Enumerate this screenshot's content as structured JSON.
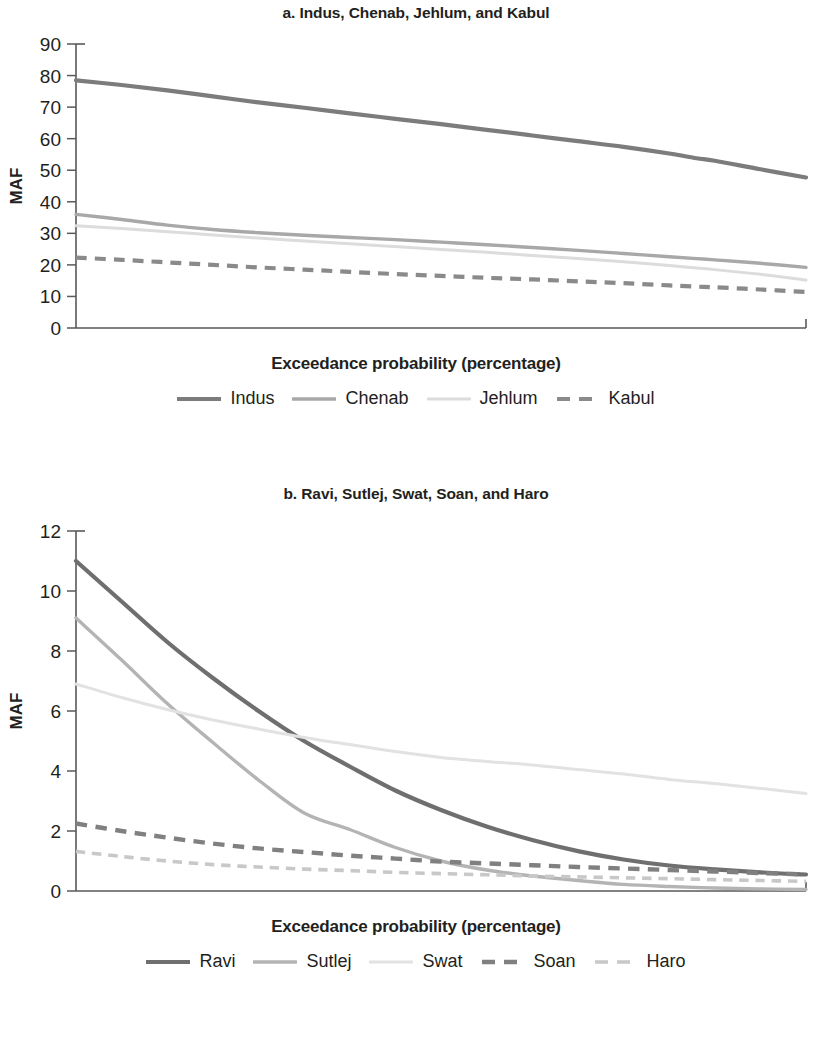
{
  "figure": {
    "y_axis_label": "MAF",
    "x_axis_label": "Exceedance probability (percentage)"
  },
  "panel_a": {
    "title": "a. Indus, Chenab, Jehlum, and Kabul",
    "x_axis_label": "Exceedance probability (percentage)",
    "y_axis_label": "MAF",
    "legend": [
      {
        "label": "Indus",
        "color": "#7c7c7c",
        "style": "solid",
        "width": 4.2
      },
      {
        "label": "Chenab",
        "color": "#a8a8a8",
        "style": "solid",
        "width": 3.4
      },
      {
        "label": "Jehlum",
        "color": "#dcdcdc",
        "style": "solid",
        "width": 3.0
      },
      {
        "label": "Kabul",
        "color": "#8a8a8a",
        "style": "dashed",
        "width": 4.2
      }
    ]
  },
  "panel_b": {
    "title": "b. Ravi, Sutlej, Swat, Soan, and Haro",
    "x_axis_label": "Exceedance probability (percentage)",
    "y_axis_label": "MAF",
    "legend": [
      {
        "label": "Ravi",
        "color": "#6f6f6f",
        "style": "solid",
        "width": 4.2
      },
      {
        "label": "Sutlej",
        "color": "#b4b4b4",
        "style": "solid",
        "width": 3.4
      },
      {
        "label": "Swat",
        "color": "#e2e2e2",
        "style": "solid",
        "width": 3.0
      },
      {
        "label": "Soan",
        "color": "#808080",
        "style": "dashed",
        "width": 4.4
      },
      {
        "label": "Haro",
        "color": "#c8c8c8",
        "style": "dashed",
        "width": 3.6
      }
    ]
  },
  "chart_data": [
    {
      "type": "line",
      "title": "a. Indus, Chenab, Jehlum, and Kabul",
      "xlabel": "Exceedance probability (percentage)",
      "ylabel": "MAF",
      "xlim": [
        10,
        90
      ],
      "ylim": [
        0,
        90
      ],
      "xticks": [
        10,
        20,
        30,
        40,
        50,
        60,
        70,
        80,
        90
      ],
      "yticks": [
        0,
        10,
        20,
        30,
        40,
        50,
        60,
        70,
        80,
        90
      ],
      "grid": false,
      "legend_position": "bottom",
      "x": [
        10,
        15,
        20,
        25,
        30,
        35,
        40,
        45,
        50,
        55,
        60,
        65,
        70,
        75,
        78,
        80,
        85,
        90
      ],
      "series": [
        {
          "name": "Indus",
          "values": [
            78.5,
            77.0,
            75.3,
            73.4,
            71.5,
            69.8,
            68.0,
            66.3,
            64.6,
            62.8,
            61.0,
            59.2,
            57.4,
            55.3,
            53.8,
            53.0,
            50.3,
            47.7
          ]
        },
        {
          "name": "Chenab",
          "values": [
            36.0,
            34.4,
            32.6,
            31.2,
            30.2,
            29.4,
            28.7,
            28.0,
            27.2,
            26.4,
            25.5,
            24.6,
            23.6,
            22.6,
            22.0,
            21.6,
            20.5,
            19.2
          ]
        },
        {
          "name": "Jehlum",
          "values": [
            32.4,
            31.5,
            30.5,
            29.5,
            28.5,
            27.6,
            26.7,
            25.8,
            24.9,
            24.0,
            23.0,
            22.0,
            21.0,
            19.8,
            19.0,
            18.5,
            17.0,
            15.2
          ]
        },
        {
          "name": "Kabul",
          "values": [
            22.3,
            21.6,
            20.8,
            20.0,
            19.2,
            18.5,
            17.8,
            17.1,
            16.5,
            15.9,
            15.4,
            14.8,
            14.2,
            13.5,
            13.1,
            12.9,
            12.2,
            11.4
          ]
        }
      ]
    },
    {
      "type": "line",
      "title": "b. Ravi, Sutlej, Swat, Soan, and Haro",
      "xlabel": "Exceedance probability (percentage)",
      "ylabel": "MAF",
      "xlim": [
        10,
        90
      ],
      "ylim": [
        0,
        12
      ],
      "xticks": [
        10,
        20,
        30,
        40,
        50,
        60,
        70,
        80,
        90
      ],
      "yticks": [
        0,
        2,
        4,
        6,
        8,
        10,
        12
      ],
      "grid": false,
      "legend_position": "bottom",
      "x": [
        10,
        15,
        20,
        25,
        30,
        35,
        40,
        45,
        50,
        55,
        60,
        65,
        70,
        75,
        80,
        85,
        90
      ],
      "series": [
        {
          "name": "Ravi",
          "values": [
            11.0,
            9.65,
            8.3,
            7.1,
            6.0,
            5.0,
            4.15,
            3.35,
            2.7,
            2.15,
            1.7,
            1.33,
            1.05,
            0.85,
            0.72,
            0.62,
            0.55
          ]
        },
        {
          "name": "Sutlej",
          "values": [
            9.1,
            7.7,
            6.25,
            4.95,
            3.7,
            2.6,
            2.05,
            1.45,
            1.0,
            0.7,
            0.5,
            0.35,
            0.22,
            0.15,
            0.1,
            0.07,
            0.05
          ]
        },
        {
          "name": "Swat",
          "values": [
            6.9,
            6.45,
            6.05,
            5.7,
            5.4,
            5.12,
            4.88,
            4.65,
            4.45,
            4.32,
            4.2,
            4.05,
            3.9,
            3.72,
            3.58,
            3.42,
            3.25
          ]
        },
        {
          "name": "Soan",
          "values": [
            2.25,
            2.0,
            1.78,
            1.58,
            1.42,
            1.3,
            1.18,
            1.08,
            0.98,
            0.92,
            0.86,
            0.8,
            0.75,
            0.7,
            0.65,
            0.6,
            0.55
          ]
        },
        {
          "name": "Haro",
          "values": [
            1.32,
            1.15,
            1.0,
            0.88,
            0.8,
            0.73,
            0.68,
            0.62,
            0.58,
            0.54,
            0.5,
            0.47,
            0.44,
            0.41,
            0.38,
            0.35,
            0.32
          ]
        }
      ]
    }
  ]
}
